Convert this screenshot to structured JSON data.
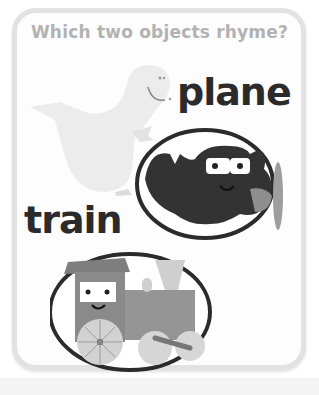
{
  "card": {
    "question": "Which two objects rhyme?",
    "words": [
      {
        "label": "plane",
        "object": "airplane"
      },
      {
        "label": "train",
        "object": "train"
      }
    ],
    "images": [
      {
        "name": "dinosaur",
        "style": "faded"
      },
      {
        "name": "airplane",
        "style": "circled"
      },
      {
        "name": "train",
        "style": "circled"
      }
    ]
  },
  "colors": {
    "border": "#e2e2e2",
    "question_text": "#b2b2b2",
    "word_text": "#2b2b2b"
  }
}
